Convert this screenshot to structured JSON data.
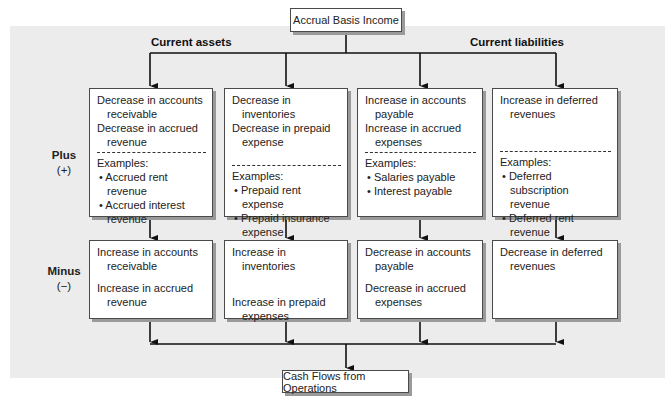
{
  "diagram": {
    "source_node": "Accrual Basis Income",
    "target_node": "Cash Flows from Operations",
    "group_labels": {
      "left": "Current assets",
      "right": "Current liabilities"
    },
    "row_labels": {
      "plus": {
        "title": "Plus",
        "sign": "(+)"
      },
      "minus": {
        "title": "Minus",
        "sign": "(−)"
      }
    },
    "columns": [
      {
        "plus": {
          "items": [
            "Decrease in accounts receivable",
            "Decrease in accrued revenue"
          ],
          "examples_label": "Examples:",
          "examples": [
            "Accrued rent revenue",
            "Accrued interest revenue"
          ]
        },
        "minus": {
          "items": [
            "Increase in accounts receivable",
            "Increase in accrued revenue"
          ]
        }
      },
      {
        "plus": {
          "items": [
            "Decrease in inventories",
            "Decrease in prepaid expense"
          ],
          "examples_label": "Examples:",
          "examples": [
            "Prepaid rent expense",
            "Prepaid insurance expense"
          ]
        },
        "minus": {
          "items": [
            "Increase in inventories",
            "Increase in prepaid expenses"
          ]
        }
      },
      {
        "plus": {
          "items": [
            "Increase in accounts payable",
            "Increase in accrued expenses"
          ],
          "examples_label": "Examples:",
          "examples": [
            "Salaries payable",
            "Interest payable"
          ]
        },
        "minus": {
          "items": [
            "Decrease in accounts payable",
            "Decrease in accrued expenses"
          ]
        }
      },
      {
        "plus": {
          "items": [
            "Increase in deferred revenues"
          ],
          "examples_label": "Examples:",
          "examples": [
            "Deferred subscription revenue",
            "Deferred rent revenue"
          ]
        },
        "minus": {
          "items": [
            "Decrease in deferred revenues"
          ]
        }
      }
    ],
    "colors": {
      "panel_background": "#ececec",
      "box_border": "#4a4a4a",
      "box_shadow": "#9a9a9a",
      "line": "#111111"
    }
  }
}
